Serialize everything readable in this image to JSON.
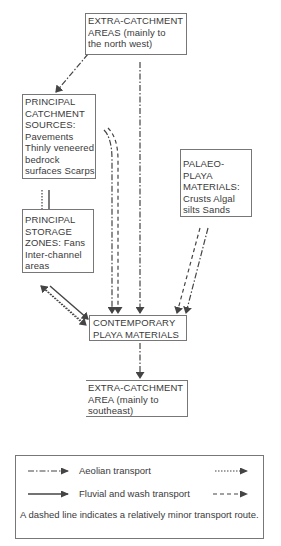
{
  "diagram": {
    "nodes": {
      "extra_catchment_nw": {
        "lines": [
          "EXTRA-CATCHMENT",
          "AREAS (mainly to",
          "the north west)"
        ]
      },
      "principal_catchment": {
        "lines": [
          "PRINCIPAL",
          "CATCHMENT",
          "SOURCES:",
          "Pavements",
          "Thinly veneered",
          "bedrock",
          "surfaces Scarps"
        ]
      },
      "palaeo_playa": {
        "lines": [
          "PALAEO-",
          "PLAYA",
          "MATERIALS:",
          "Crusts Algal",
          "silts  Sands"
        ]
      },
      "principal_storage": {
        "lines": [
          "PRINCIPAL",
          "STORAGE",
          "ZONES: Fans",
          "Inter-channel",
          "areas"
        ]
      },
      "contemporary_playa": {
        "lines": [
          "CONTEMPORARY",
          "PLAYA MATERIALS"
        ]
      },
      "extra_catchment_se": {
        "lines": [
          "EXTRA-CATCHMENT",
          "AREA (mainly to",
          "southeast)"
        ]
      }
    },
    "edges": [
      {
        "from": "extra_catchment_nw",
        "to": "principal_catchment",
        "type": "aeolian-major"
      },
      {
        "from": "extra_catchment_nw",
        "to": "contemporary_playa",
        "type": "aeolian-major"
      },
      {
        "from": "principal_catchment",
        "to": "principal_storage",
        "type": "aeolian-minor"
      },
      {
        "from": "principal_catchment",
        "to": "principal_storage",
        "type": "fluvial-major"
      },
      {
        "from": "principal_catchment",
        "to": "contemporary_playa",
        "type": "aeolian-major"
      },
      {
        "from": "principal_catchment",
        "to": "contemporary_playa",
        "type": "fluvial-minor"
      },
      {
        "from": "palaeo_playa",
        "to": "contemporary_playa",
        "type": "fluvial-minor"
      },
      {
        "from": "palaeo_playa",
        "to": "contemporary_playa",
        "type": "aeolian-major"
      },
      {
        "from": "principal_storage",
        "to": "contemporary_playa",
        "type": "fluvial-major"
      },
      {
        "from": "principal_storage",
        "to": "contemporary_playa",
        "type": "aeolian-minor"
      },
      {
        "from": "contemporary_playa",
        "to": "principal_storage",
        "type": "aeolian-minor"
      },
      {
        "from": "contemporary_playa",
        "to": "extra_catchment_se",
        "type": "aeolian-major"
      }
    ]
  },
  "legend": {
    "aeolian_label": "Aeolian  transport",
    "fluvial_label": "Fluvial and wash transport",
    "note": "A dashed line indicates a relatively minor transport route."
  },
  "colors": {
    "ink": "#333333",
    "border": "#777777",
    "background": "#ffffff"
  }
}
